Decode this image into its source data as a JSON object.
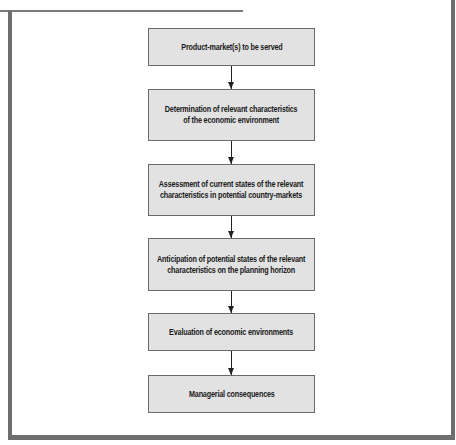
{
  "diagram": {
    "type": "vertical-flowchart",
    "colors": {
      "box_fill": "#e2e2e2",
      "box_border": "#6a6a6a",
      "frame": "#6e6e6e",
      "arrow": "#222222"
    },
    "steps": [
      {
        "lines": [
          "Product-market(s) to be served"
        ]
      },
      {
        "lines": [
          "Determination of relevant characteristics",
          "of the economic environment"
        ]
      },
      {
        "lines": [
          "Assessment of current states of the relevant",
          "characteristics in potential country-markets"
        ]
      },
      {
        "lines": [
          "Anticipation of potential states of the relevant",
          "characteristics on the planning horizon"
        ]
      },
      {
        "lines": [
          "Evaluation of economic environments"
        ]
      },
      {
        "lines": [
          "Managerial consequences"
        ]
      }
    ],
    "edges": [
      {
        "from": 0,
        "to": 1
      },
      {
        "from": 1,
        "to": 2
      },
      {
        "from": 2,
        "to": 3
      },
      {
        "from": 3,
        "to": 4
      },
      {
        "from": 4,
        "to": 5
      }
    ]
  }
}
